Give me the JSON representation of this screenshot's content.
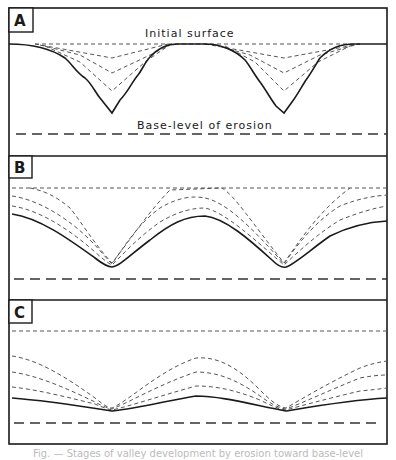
{
  "figure": {
    "panels": [
      {
        "id": "A",
        "label": "A",
        "stage": "youth",
        "annotations": {
          "top": "Initial surface",
          "bottom": "Base-level of erosion"
        },
        "profile_count": {
          "dashed_intermediate": 3,
          "solid_current": 1
        }
      },
      {
        "id": "B",
        "label": "B",
        "stage": "maturity",
        "profile_count": {
          "dashed_intermediate": 4,
          "solid_current": 1
        }
      },
      {
        "id": "C",
        "label": "C",
        "stage": "old age",
        "profile_count": {
          "dashed_intermediate": 4,
          "solid_current": 1
        }
      }
    ],
    "legend_lines": {
      "initial_surface": "short dashed line",
      "intermediate_profiles": "short dashed lines",
      "current_profile": "solid line",
      "base_level": "long dashed line"
    },
    "caption": "Fig. — Stages of valley development by erosion toward base-level"
  },
  "colors": {
    "ink": "#1a1a1a",
    "dashed": "#555555",
    "background": "#ffffff"
  }
}
